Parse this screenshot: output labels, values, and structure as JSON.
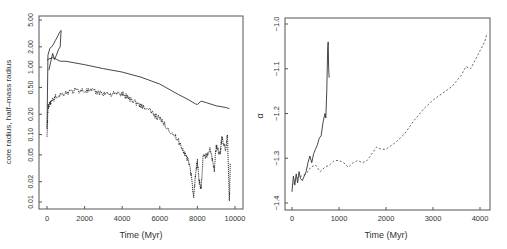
{
  "chart_data": [
    {
      "type": "line",
      "title": "",
      "xlabel": "Time (Myr)",
      "ylabel": "core radius, half–mass radius",
      "yscale": "log",
      "xlim": [
        -200,
        10300
      ],
      "ylim": [
        0.0085,
        5.5
      ],
      "xticks": [
        0,
        2000,
        4000,
        6000,
        8000,
        10000
      ],
      "xtick_labels": [
        "0",
        "2000",
        "4000",
        "6000",
        "8000",
        "10000"
      ],
      "yticks": [
        0.01,
        0.02,
        0.05,
        0.1,
        0.2,
        0.5,
        1.0,
        2.0,
        5.0
      ],
      "ytick_labels": [
        "0.01",
        "0.02",
        "0.05",
        "0.10",
        "0.20",
        "0.50",
        "1.00",
        "2.00",
        "5.00"
      ],
      "grid": false,
      "legend": null,
      "series": [
        {
          "name": "half-mass radius",
          "style": "solid",
          "x": [
            0,
            100,
            300,
            500,
            700,
            1000,
            2000,
            3000,
            4000,
            5000,
            6000,
            7000,
            7500,
            7900,
            8000,
            8200,
            8500,
            9000,
            9500,
            9700
          ],
          "y": [
            1.3,
            1.35,
            1.35,
            1.3,
            1.25,
            1.2,
            1.08,
            0.95,
            0.85,
            0.7,
            0.55,
            0.4,
            0.33,
            0.28,
            0.28,
            0.31,
            0.29,
            0.27,
            0.25,
            0.24
          ]
        },
        {
          "name": "half-mass radius (early transient)",
          "style": "solid",
          "x": [
            0,
            50,
            150,
            250,
            350,
            450,
            550,
            650,
            750,
            700,
            600,
            500,
            400,
            300,
            200,
            100
          ],
          "y": [
            0.12,
            1.5,
            1.9,
            2.0,
            2.2,
            2.5,
            2.8,
            3.2,
            3.5,
            2.0,
            1.8,
            1.5,
            1.3,
            1.6,
            1.2,
            0.9
          ]
        },
        {
          "name": "core radius",
          "style": "dotted",
          "x": [
            0,
            50,
            200,
            500,
            1000,
            1500,
            2000,
            2500,
            3000,
            3500,
            4000,
            4500,
            5000,
            5500,
            6000,
            6500,
            7000,
            7300,
            7600,
            7800,
            7900,
            8000,
            8100,
            8200,
            8300,
            8500,
            8700,
            8900,
            9000,
            9200,
            9300,
            9500,
            9600,
            9700,
            9750
          ],
          "y": [
            0.09,
            0.25,
            0.3,
            0.37,
            0.42,
            0.45,
            0.45,
            0.43,
            0.41,
            0.4,
            0.4,
            0.33,
            0.27,
            0.22,
            0.17,
            0.12,
            0.08,
            0.055,
            0.035,
            0.012,
            0.025,
            0.04,
            0.02,
            0.015,
            0.045,
            0.05,
            0.06,
            0.03,
            0.07,
            0.05,
            0.09,
            0.06,
            0.1,
            0.01,
            0.04
          ]
        }
      ]
    },
    {
      "type": "line",
      "title": "",
      "xlabel": "Time (Myr)",
      "ylabel": "α",
      "xlim": [
        -150,
        4200
      ],
      "ylim": [
        -1.415,
        -0.985
      ],
      "xticks": [
        0,
        1000,
        2000,
        3000,
        4000
      ],
      "xtick_labels": [
        "0",
        "1000",
        "2000",
        "3000",
        "4000"
      ],
      "yticks": [
        -1.4,
        -1.3,
        -1.2,
        -1.1,
        -1.0
      ],
      "ytick_labels": [
        "−1.4",
        "−1.3",
        "−1.2",
        "−1.1",
        "−1.0"
      ],
      "grid": false,
      "legend": null,
      "series": [
        {
          "name": "solid",
          "style": "solid",
          "x": [
            0,
            30,
            60,
            90,
            120,
            150,
            180,
            220,
            260,
            300,
            340,
            380,
            420,
            460,
            500,
            540,
            580,
            620,
            660,
            700,
            720,
            740,
            760,
            770,
            780,
            790
          ],
          "y": [
            -1.375,
            -1.34,
            -1.36,
            -1.335,
            -1.355,
            -1.33,
            -1.345,
            -1.35,
            -1.34,
            -1.33,
            -1.31,
            -1.295,
            -1.31,
            -1.29,
            -1.28,
            -1.27,
            -1.255,
            -1.25,
            -1.22,
            -1.2,
            -1.21,
            -1.15,
            -1.05,
            -1.04,
            -1.1,
            -1.12
          ]
        },
        {
          "name": "dashed",
          "style": "dashed",
          "x": [
            0,
            100,
            200,
            300,
            400,
            500,
            600,
            700,
            800,
            900,
            1000,
            1100,
            1200,
            1300,
            1400,
            1500,
            1600,
            1700,
            1800,
            1900,
            2000,
            2200,
            2400,
            2600,
            2800,
            3000,
            3200,
            3400,
            3600,
            3700,
            3800,
            3900,
            4000,
            4100,
            4150
          ],
          "y": [
            -1.36,
            -1.345,
            -1.34,
            -1.335,
            -1.32,
            -1.315,
            -1.33,
            -1.32,
            -1.315,
            -1.305,
            -1.305,
            -1.31,
            -1.32,
            -1.31,
            -1.305,
            -1.31,
            -1.305,
            -1.29,
            -1.275,
            -1.28,
            -1.28,
            -1.265,
            -1.245,
            -1.215,
            -1.19,
            -1.17,
            -1.155,
            -1.14,
            -1.115,
            -1.095,
            -1.1,
            -1.08,
            -1.06,
            -1.04,
            -1.02
          ]
        }
      ]
    }
  ]
}
